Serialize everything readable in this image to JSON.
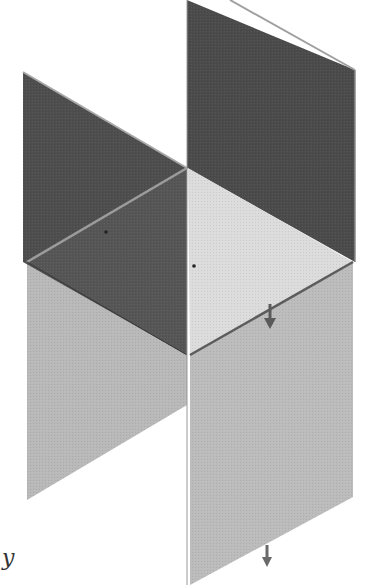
{
  "diagram": {
    "type": "isometric-planes",
    "colors": {
      "background": "#ffffff",
      "dark_plane": "#4a4a4a",
      "dark_plane_front": "#555555",
      "light_floor": "#d9d9d9",
      "lower_plane": "#b8b8b8",
      "edge_highlight": "#9a9a9a",
      "arrow": "#5a5a5a"
    },
    "planes": [
      {
        "name": "upper-right-vertical-plane",
        "shade": "dark",
        "points": "187,0 355,70 355,262 187,168"
      },
      {
        "name": "upper-left-vertical-plane",
        "shade": "dark",
        "points": "23,72 187,168 187,355 23,262"
      },
      {
        "name": "horizontal-plane-right",
        "shade": "light",
        "points": "187,168 353,262 190,355"
      },
      {
        "name": "horizontal-plane-left",
        "shade": "dark",
        "points": "27,262 187,168 187,355"
      },
      {
        "name": "lower-left-vertical-plane",
        "shade": "medium",
        "points": "27,262 187,355 187,405 27,500"
      },
      {
        "name": "lower-right-vertical-plane",
        "shade": "medium",
        "points": "190,355 353,262 353,497 190,585"
      }
    ],
    "arrows": [
      {
        "name": "normal-arrow-upper",
        "x": 270,
        "y1": 305,
        "y2": 327
      },
      {
        "name": "normal-arrow-lower",
        "x": 266,
        "y1": 545,
        "y2": 565
      }
    ],
    "axis_label": "y"
  }
}
